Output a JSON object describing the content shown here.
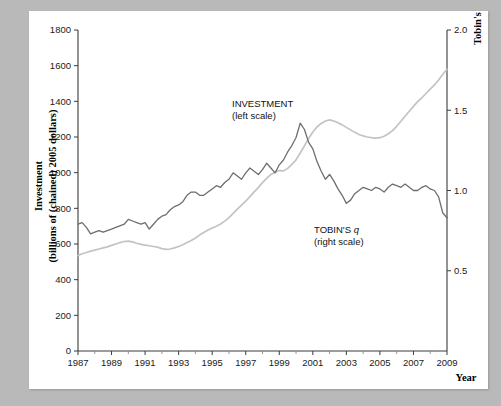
{
  "figure": {
    "background_color": "#b9b9b9",
    "card_color": "#ffffff"
  },
  "axes": {
    "left_title_line1": "Investment",
    "left_title_line2": "(billions of  (chained) 2005 dollars)",
    "right_title": "Tobin's q",
    "x_title": "Year",
    "left_ticks": [
      "0",
      "200",
      "400",
      "600",
      "800",
      "1000",
      "1200",
      "1400",
      "1600",
      "1800"
    ],
    "right_ticks": [
      "0.5",
      "1.0",
      "1.5",
      "2.0"
    ],
    "x_ticks": [
      "1987",
      "1989",
      "1991",
      "1993",
      "1995",
      "1997",
      "1999",
      "2001",
      "2003",
      "2005",
      "2007",
      "2009"
    ]
  },
  "annotations": {
    "investment_label_line1": "INVESTMENT",
    "investment_label_line2": "(left scale)",
    "tobin_label_line1_a": "TOBIN'S ",
    "tobin_label_line1_b": "q",
    "tobin_label_line2": "(right scale)"
  },
  "chart_data": {
    "type": "line",
    "title": "",
    "xlabel": "Year",
    "ylabel": "Investment (billions of (chained) 2005 dollars)",
    "y2label": "Tobin's q",
    "xlim": [
      1987,
      2009
    ],
    "ylim": [
      0,
      1800
    ],
    "y2lim": [
      0,
      2.0
    ],
    "grid": false,
    "legend_position": "inline-annotations",
    "series": [
      {
        "name": "INVESTMENT (left scale)",
        "axis": "left",
        "color": "#c3c3c3",
        "units": "billions of chained 2005 dollars",
        "x": [
          1987.0,
          1987.25,
          1987.5,
          1987.75,
          1988.0,
          1988.25,
          1988.5,
          1988.75,
          1989.0,
          1989.25,
          1989.5,
          1989.75,
          1990.0,
          1990.25,
          1990.5,
          1990.75,
          1991.0,
          1991.25,
          1991.5,
          1991.75,
          1992.0,
          1992.25,
          1992.5,
          1992.75,
          1993.0,
          1993.25,
          1993.5,
          1993.75,
          1994.0,
          1994.25,
          1994.5,
          1994.75,
          1995.0,
          1995.25,
          1995.5,
          1995.75,
          1996.0,
          1996.25,
          1996.5,
          1996.75,
          1997.0,
          1997.25,
          1997.5,
          1997.75,
          1998.0,
          1998.25,
          1998.5,
          1998.75,
          1999.0,
          1999.25,
          1999.5,
          1999.75,
          2000.0,
          2000.25,
          2000.5,
          2000.75,
          2001.0,
          2001.25,
          2001.5,
          2001.75,
          2002.0,
          2002.25,
          2002.5,
          2002.75,
          2003.0,
          2003.25,
          2003.5,
          2003.75,
          2004.0,
          2004.25,
          2004.5,
          2004.75,
          2005.0,
          2005.25,
          2005.5,
          2005.75,
          2006.0,
          2006.25,
          2006.5,
          2006.75,
          2007.0,
          2007.25,
          2007.5,
          2007.75,
          2008.0,
          2008.25,
          2008.5,
          2008.75,
          2009.0
        ],
        "y": [
          535,
          545,
          552,
          560,
          566,
          572,
          578,
          584,
          592,
          600,
          608,
          614,
          616,
          612,
          604,
          598,
          594,
          590,
          586,
          582,
          574,
          570,
          572,
          578,
          586,
          596,
          608,
          620,
          634,
          650,
          664,
          678,
          690,
          700,
          712,
          728,
          748,
          772,
          796,
          818,
          840,
          866,
          892,
          916,
          944,
          968,
          990,
          1002,
          1012,
          1010,
          1024,
          1046,
          1072,
          1110,
          1150,
          1192,
          1228,
          1256,
          1276,
          1290,
          1296,
          1290,
          1280,
          1268,
          1254,
          1240,
          1226,
          1214,
          1206,
          1200,
          1196,
          1194,
          1196,
          1204,
          1218,
          1236,
          1260,
          1288,
          1316,
          1344,
          1372,
          1398,
          1420,
          1444,
          1468,
          1492,
          1520,
          1552,
          1580
        ]
      },
      {
        "name": "TOBIN'S q (right scale)",
        "axis": "right",
        "color": "#6e6e6e",
        "units": "ratio",
        "x": [
          1987.0,
          1987.25,
          1987.5,
          1987.75,
          1988.0,
          1988.25,
          1988.5,
          1988.75,
          1989.0,
          1989.25,
          1989.5,
          1989.75,
          1990.0,
          1990.25,
          1990.5,
          1990.75,
          1991.0,
          1991.25,
          1991.5,
          1991.75,
          1992.0,
          1992.25,
          1992.5,
          1992.75,
          1993.0,
          1993.25,
          1993.5,
          1993.75,
          1994.0,
          1994.25,
          1994.5,
          1994.75,
          1995.0,
          1995.25,
          1995.5,
          1995.75,
          1996.0,
          1996.25,
          1996.5,
          1996.75,
          1997.0,
          1997.25,
          1997.5,
          1997.75,
          1998.0,
          1998.25,
          1998.5,
          1998.75,
          1999.0,
          1999.25,
          1999.5,
          1999.75,
          2000.0,
          2000.25,
          2000.5,
          2000.75,
          2001.0,
          2001.25,
          2001.5,
          2001.75,
          2002.0,
          2002.25,
          2002.5,
          2002.75,
          2003.0,
          2003.25,
          2003.5,
          2003.75,
          2004.0,
          2004.25,
          2004.5,
          2004.75,
          2005.0,
          2005.25,
          2005.5,
          2005.75,
          2006.0,
          2006.25,
          2006.5,
          2006.75,
          2007.0,
          2007.25,
          2007.5,
          2007.75,
          2008.0,
          2008.25,
          2008.5,
          2008.75,
          2009.0
        ],
        "y": [
          0.79,
          0.8,
          0.77,
          0.73,
          0.74,
          0.75,
          0.74,
          0.75,
          0.76,
          0.77,
          0.78,
          0.79,
          0.82,
          0.81,
          0.8,
          0.79,
          0.8,
          0.76,
          0.79,
          0.82,
          0.84,
          0.85,
          0.88,
          0.9,
          0.91,
          0.93,
          0.97,
          0.99,
          0.99,
          0.97,
          0.97,
          0.99,
          1.01,
          1.03,
          1.02,
          1.05,
          1.07,
          1.11,
          1.09,
          1.07,
          1.11,
          1.14,
          1.12,
          1.1,
          1.13,
          1.17,
          1.14,
          1.11,
          1.16,
          1.19,
          1.24,
          1.28,
          1.33,
          1.42,
          1.38,
          1.3,
          1.26,
          1.18,
          1.12,
          1.07,
          1.1,
          1.06,
          1.01,
          0.97,
          0.92,
          0.94,
          0.98,
          1.0,
          1.02,
          1.01,
          1.0,
          1.02,
          1.01,
          0.99,
          1.02,
          1.04,
          1.03,
          1.02,
          1.04,
          1.02,
          1.0,
          1.0,
          1.02,
          1.03,
          1.01,
          1.0,
          0.96,
          0.86,
          0.83
        ]
      }
    ]
  }
}
